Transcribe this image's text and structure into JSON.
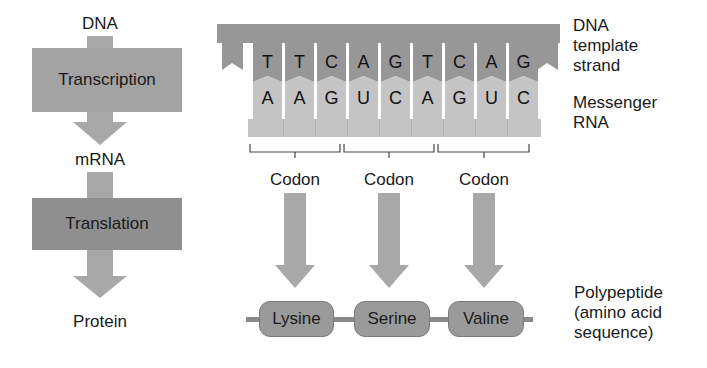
{
  "flow": {
    "steps": [
      {
        "label": "DNA"
      },
      {
        "label": "mRNA"
      },
      {
        "label": "Protein"
      }
    ],
    "processes": [
      {
        "label": "Transcription",
        "color": "#a3a3a3"
      },
      {
        "label": "Translation",
        "color": "#8f8f8f"
      }
    ],
    "arrow_color": "#a8a8a8"
  },
  "strand": {
    "dna_color": "#979797",
    "rna_color": "#c4c4c4",
    "dna_bases": [
      "T",
      "T",
      "C",
      "A",
      "G",
      "T",
      "C",
      "A",
      "G"
    ],
    "rna_bases": [
      "A",
      "A",
      "G",
      "U",
      "C",
      "A",
      "G",
      "U",
      "C"
    ]
  },
  "codons": [
    {
      "label": "Codon",
      "amino_acid": "Lysine"
    },
    {
      "label": "Codon",
      "amino_acid": "Serine"
    },
    {
      "label": "Codon",
      "amino_acid": "Valine"
    }
  ],
  "polypeptide": {
    "bead_color": "#9a9a9a",
    "line_color": "#8a8a8a"
  },
  "side_labels": {
    "dna_template": [
      "DNA",
      "template",
      "strand"
    ],
    "mrna": [
      "Messenger",
      "RNA"
    ],
    "polypeptide": [
      "Polypeptide",
      "(amino acid",
      "sequence)"
    ]
  }
}
